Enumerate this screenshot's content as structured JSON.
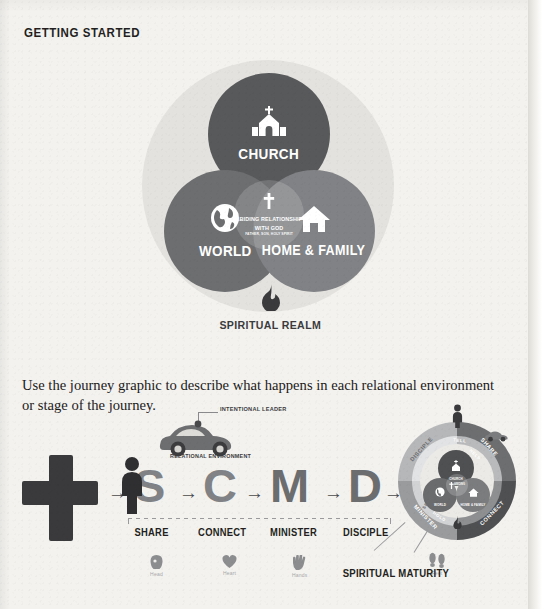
{
  "heading": "GETTING STARTED",
  "venn": {
    "church": {
      "label": "CHURCH",
      "icon": "church-icon"
    },
    "world": {
      "label": "WORLD",
      "icon": "globe-icon"
    },
    "home": {
      "label": "HOME & FAMILY",
      "icon": "house-icon"
    },
    "center": {
      "title_line1": "ABIDING RELATIONSHIP",
      "title_line2": "WITH GOD",
      "subtitle": "FATHER, SON, HOLY SPIRIT",
      "icon": "cross-icon"
    },
    "spiritual_realm": {
      "label": "SPIRITUAL REALM",
      "icon": "flame-icon"
    }
  },
  "body_text": "Use the journey graphic to describe what happens in each relational environment or stage of the journey.",
  "journey": {
    "cross_icon": "cross-icon",
    "arrow": "→",
    "letters": [
      "S",
      "C",
      "M",
      "D"
    ],
    "car": {
      "leader_label": "INTENTIONAL LEADER",
      "environment_label": "RELATIONAL ENVIRONMENT"
    },
    "stages": [
      "SHARE",
      "CONNECT",
      "MINISTER",
      "DISCIPLE"
    ],
    "attributes": [
      {
        "label": "Head",
        "icon": "head-icon"
      },
      {
        "label": "Heart",
        "icon": "heart-icon"
      },
      {
        "label": "Hands",
        "icon": "hands-icon"
      },
      {
        "label": "Feet",
        "icon": "feet-icon"
      }
    ],
    "maturity_label": "SPIRITUAL MATURITY"
  },
  "wheel": {
    "outer_labels": [
      "SHARE",
      "CONNECT",
      "MINISTER",
      "DISCIPLE"
    ],
    "inner_labels": [
      "TELL",
      "HELP",
      "HOLD",
      "SEND"
    ],
    "mini": {
      "church": "CHURCH",
      "world": "WORLD",
      "home": "HOME & FAMILY",
      "center1": "ABIDING",
      "center2": "WITH GOD",
      "spiritual": "SPIRITUAL REALM"
    }
  },
  "colors": {
    "paper": "#f3f2ef",
    "ink": "#231f20",
    "church": "#58595b",
    "world": "#6d6e70",
    "home": "#808285",
    "halo": "#e3e2de"
  }
}
